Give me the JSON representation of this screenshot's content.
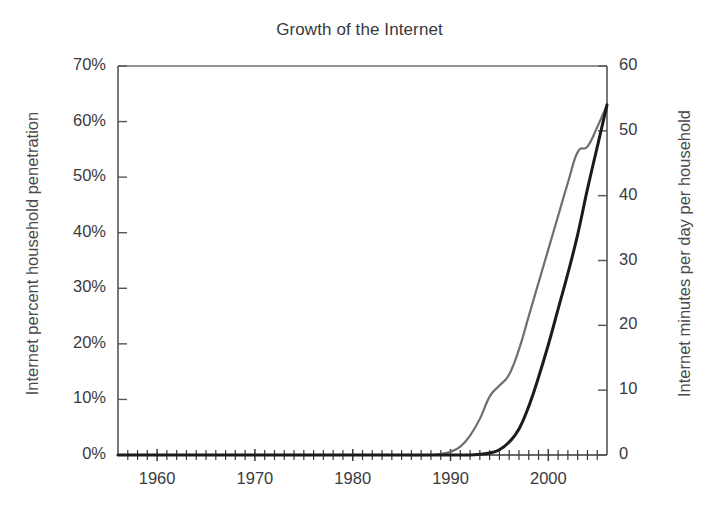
{
  "chart_data": {
    "type": "line",
    "title": "Growth of the Internet",
    "xlabel": "",
    "ylabel": "Internet percent household penetration",
    "y2label": "Internet minutes per day per household",
    "xlim": [
      1956,
      2006
    ],
    "ylim": [
      0,
      70
    ],
    "y2lim": [
      0,
      60
    ],
    "grid": false,
    "legend": "none",
    "x_ticks": [
      1960,
      1970,
      1980,
      1990,
      2000
    ],
    "x_tick_labels": [
      "1960",
      "1970",
      "1980",
      "1990",
      "2000"
    ],
    "x_minor_tick_step": 1,
    "y_ticks": [
      0,
      10,
      20,
      30,
      40,
      50,
      60,
      70
    ],
    "y_tick_labels": [
      "0%",
      "10%",
      "20%",
      "30%",
      "40%",
      "50%",
      "60%",
      "70%"
    ],
    "y2_ticks": [
      0,
      10,
      20,
      30,
      40,
      50,
      60
    ],
    "y2_tick_labels": [
      "0",
      "10",
      "20",
      "30",
      "40",
      "50",
      "60"
    ],
    "series": [
      {
        "name": "Internet percent household penetration",
        "axis": "left",
        "color": "#6e6e70",
        "units": "percent",
        "x": [
          1956,
          1960,
          1965,
          1970,
          1975,
          1980,
          1985,
          1988,
          1989,
          1990,
          1991,
          1992,
          1993,
          1994,
          1995,
          1996,
          1997,
          1998,
          1999,
          2000,
          2001,
          2002,
          2003,
          2004,
          2005,
          2006
        ],
        "values": [
          0,
          0,
          0,
          0,
          0,
          0,
          0,
          0,
          0.2,
          0.6,
          1.5,
          3.5,
          6.5,
          10.5,
          12.5,
          14.5,
          19,
          25,
          31,
          37,
          43,
          49,
          54.5,
          55.5,
          59,
          63
        ]
      },
      {
        "name": "Internet minutes per day per household",
        "axis": "right",
        "color": "#1b1b1b",
        "units": "minutes per day",
        "x": [
          1956,
          1960,
          1965,
          1970,
          1975,
          1980,
          1985,
          1990,
          1992,
          1993,
          1994,
          1995,
          1996,
          1997,
          1998,
          1999,
          2000,
          2001,
          2002,
          2003,
          2004,
          2005,
          2006
        ],
        "values": [
          0,
          0,
          0,
          0,
          0,
          0,
          0,
          0,
          0,
          0.1,
          0.3,
          0.8,
          2.0,
          4.0,
          7.5,
          12.0,
          17.0,
          22.5,
          28.0,
          34.0,
          41.0,
          47.5,
          54.0
        ]
      }
    ]
  }
}
